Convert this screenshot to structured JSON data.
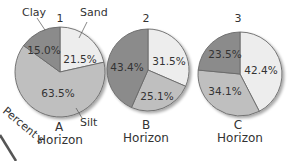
{
  "colors": {
    "sand": "#ededed",
    "silt": "#bfbfbf",
    "clay": "#8b8b8b",
    "outline": "#6a6a6a"
  },
  "legend_labels": {
    "clay": "Clay",
    "sand": "Sand",
    "silt": "Silt"
  },
  "side_text": "Percent s",
  "chart_data": [
    {
      "type": "pie",
      "title": "1",
      "horizon_letter": "A",
      "horizon_word": "Horizon",
      "categories": [
        "Sand",
        "Silt",
        "Clay"
      ],
      "values": [
        21.5,
        63.5,
        15.0
      ],
      "labels": [
        "21.5%",
        "63.5%",
        "15.0%"
      ]
    },
    {
      "type": "pie",
      "title": "2",
      "horizon_letter": "B",
      "horizon_word": "Horizon",
      "categories": [
        "Sand",
        "Silt",
        "Clay"
      ],
      "values": [
        31.5,
        25.1,
        43.4
      ],
      "labels": [
        "31.5%",
        "25.1%",
        "43.4%"
      ]
    },
    {
      "type": "pie",
      "title": "3",
      "horizon_letter": "C",
      "horizon_word": "Horizon",
      "categories": [
        "Sand",
        "Silt",
        "Clay"
      ],
      "values": [
        42.4,
        34.1,
        23.5
      ],
      "labels": [
        "42.4%",
        "34.1%",
        "23.5%"
      ]
    }
  ]
}
